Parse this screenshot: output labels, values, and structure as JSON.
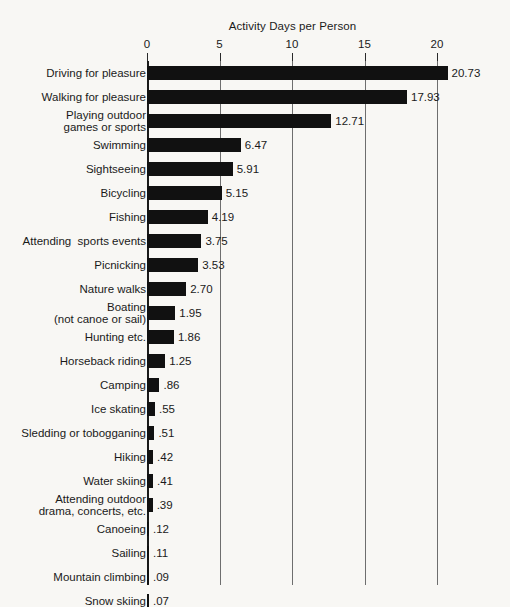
{
  "chart_data": {
    "type": "bar",
    "orientation": "horizontal",
    "title": "Activity Days per Person",
    "xlabel": "",
    "ylabel": "",
    "xlim": [
      0,
      22
    ],
    "xticks": [
      0,
      5,
      10,
      15,
      20
    ],
    "xtick_labels": [
      "0",
      "5",
      "10",
      "15",
      "20"
    ],
    "grid": true,
    "grid_axis": "x",
    "legend": false,
    "bar_color": "#111111",
    "categories": [
      "Driving for pleasure",
      "Walking for pleasure",
      "Playing outdoor\ngames or sports",
      "Swimming",
      "Sightseeing",
      "Bicycling",
      "Fishing",
      "Attending  sports events",
      "Picnicking",
      "Nature walks",
      "Boating\n(not canoe or sail)",
      "Hunting etc.",
      "Horseback riding",
      "Camping",
      "Ice skating",
      "Sledding or tobogganing",
      "Hiking",
      "Water skiing",
      "Attending outdoor\ndrama, concerts, etc.",
      "Canoeing",
      "Sailing",
      "Mountain climbing",
      "Snow skiing"
    ],
    "values": [
      20.73,
      17.93,
      12.71,
      6.47,
      5.91,
      5.15,
      4.19,
      3.75,
      3.53,
      2.7,
      1.95,
      1.86,
      1.25,
      0.86,
      0.55,
      0.51,
      0.42,
      0.41,
      0.39,
      0.12,
      0.11,
      0.09,
      0.07
    ],
    "value_labels": [
      "20.73",
      "17.93",
      "12.71",
      "6.47",
      "5.91",
      "5.15",
      "4.19",
      "3.75",
      "3.53",
      "2.70",
      "1.95",
      "1.86",
      "1.25",
      ".86",
      ".55",
      ".51",
      ".42",
      ".41",
      ".39",
      ".12",
      ".11",
      ".09",
      ".07"
    ]
  }
}
